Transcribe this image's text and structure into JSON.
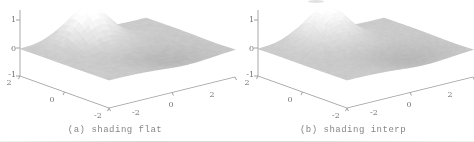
{
  "figure": {
    "background": "#ffffff",
    "panels": [
      {
        "id": "a",
        "caption": "(a) shading flat",
        "shading": "flat"
      },
      {
        "id": "b",
        "caption": "(b) shading interp",
        "shading": "interp"
      }
    ],
    "axis_labels": {
      "z_ticks": [
        "1",
        "0",
        "-1"
      ],
      "left_ticks": [
        "2",
        "0",
        "-2"
      ],
      "right_ticks": [
        "-2",
        "0",
        "2"
      ]
    },
    "colors": {
      "axis_line": "#a0a0a0",
      "tick_label": "#757575",
      "caption": "#878787",
      "surface_mid": "#cbcbcb",
      "surface_top": "#fafafa",
      "surface_dip": "#b8b8b8"
    }
  },
  "chart_data": {
    "type": "surface",
    "title": "",
    "subtitle": "MATLAB surf shading comparison: flat vs interp",
    "x_range": [
      -2,
      2
    ],
    "y_range": [
      -2,
      2
    ],
    "z_range": [
      -1,
      1
    ],
    "x_ticks": [
      -2,
      0,
      2
    ],
    "y_ticks": [
      2,
      0,
      -2
    ],
    "z_ticks": [
      1,
      0,
      -1
    ],
    "grid_on": false,
    "surface_function": "z = peak.height*exp(-((v-peak.v0)^2+(u-peak.u0)^2)/peak.spread) - dip.depth*exp(-((v-dip.v0)^2+(u-dip.u0)^2)/dip.spread)",
    "peak": {
      "v0": -0.3,
      "u0": 1.3,
      "height": 1.25,
      "spread": 0.6
    },
    "dip": {
      "v0": 0.5,
      "u0": -1.2,
      "depth": 0.22,
      "spread": 1.3
    },
    "series": [
      {
        "name": "shading flat",
        "grid_cells": 32
      },
      {
        "name": "shading interp",
        "grid_cells": 48
      }
    ]
  }
}
